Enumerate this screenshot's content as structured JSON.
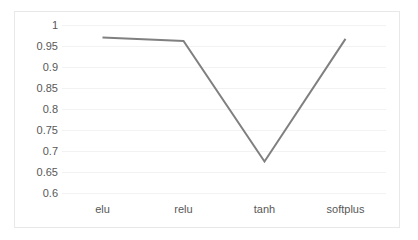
{
  "chart_data": {
    "type": "line",
    "title": "",
    "subtitle": "",
    "xlabel": "",
    "ylabel": "",
    "categories": [
      "elu",
      "relu",
      "tanh",
      "softplus"
    ],
    "values": [
      0.97,
      0.962,
      0.675,
      0.967
    ],
    "series": [
      {
        "name": "accuracy",
        "values": [
          0.97,
          0.962,
          0.675,
          0.967
        ],
        "color": "#808080"
      }
    ],
    "ylim": [
      0.6,
      1.0
    ],
    "ytick_labels": [
      "1",
      "0.95",
      "0.9",
      "0.85",
      "0.8",
      "0.75",
      "0.7",
      "0.65",
      "0.6"
    ],
    "ytick_values": [
      1,
      0.95,
      0.9,
      0.85,
      0.8,
      0.75,
      0.7,
      0.65,
      0.6
    ],
    "xtick_labels": [
      "elu",
      "relu",
      "tanh",
      "softplus"
    ],
    "grid": true,
    "grid_axis": "y",
    "legend": false,
    "legend_position": "none",
    "markers": false,
    "line_width": 2,
    "annotations": []
  },
  "style": {
    "line_color": "#808080",
    "grid_color": "#f2f2f2",
    "frame_color": "#e8e8e8",
    "text_color": "#585858",
    "background": "#ffffff"
  }
}
